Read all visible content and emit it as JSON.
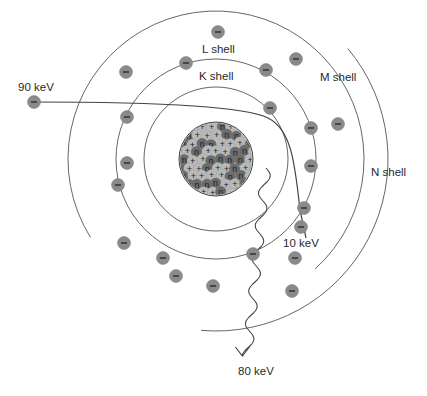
{
  "diagram": {
    "colors": {
      "shell_line": "#555555",
      "electron_fill": "#8a8a8a",
      "proton_fill": "#b9b9b9",
      "neutron_fill": "#6b6b6b",
      "path_line": "#444444",
      "text": "#2a2a2a"
    },
    "nucleus": {
      "center": [
        216,
        159
      ],
      "radius": 37,
      "proton_symbol": "+",
      "neutron_symbol": "n"
    },
    "shells": [
      {
        "name": "K shell",
        "label": "K shell",
        "radius": 72,
        "electrons": 2
      },
      {
        "name": "L shell",
        "label": "L shell",
        "radius": 100,
        "electrons": 8
      },
      {
        "name": "M shell",
        "label": "M shell",
        "radius": 128,
        "electrons": 8
      },
      {
        "name": "N shell",
        "label": "N shell",
        "radius": 152,
        "electrons": 0
      }
    ],
    "labels": {
      "incident": "90 keV",
      "exiting": "10 keV",
      "photon": "80 keV",
      "k_shell": "K shell",
      "l_shell": "L shell",
      "m_shell": "M shell",
      "n_shell": "N shell"
    },
    "electron_symbol": "−"
  }
}
